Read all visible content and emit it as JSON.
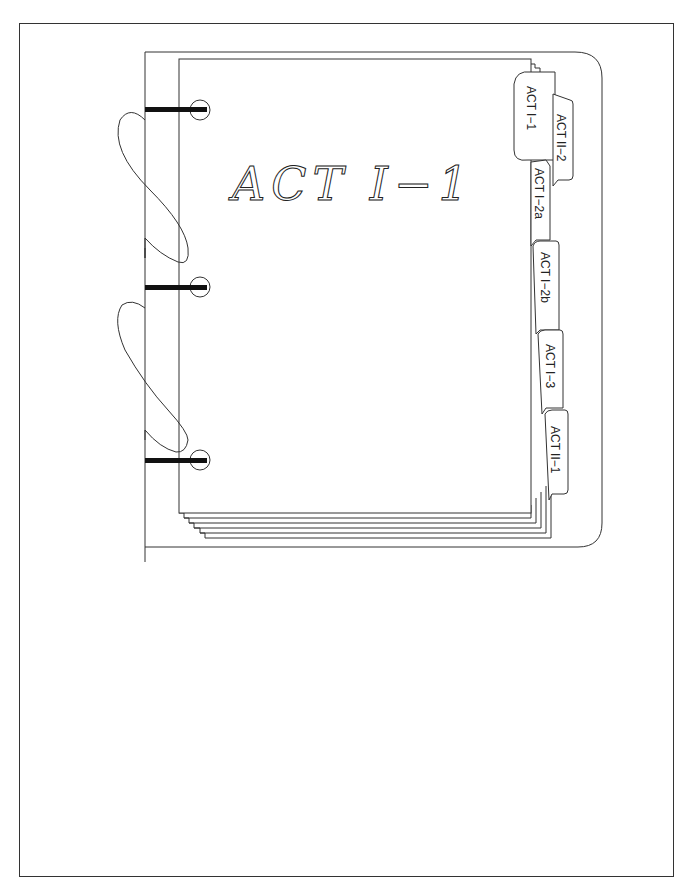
{
  "diagram": {
    "type": "binder-with-tab-dividers",
    "cover_title": "ACT I-1",
    "cover_title_display": "ACT  I−1",
    "rings": 3,
    "tabs": [
      {
        "label": "ACT I-1",
        "display": "ACT  I−1"
      },
      {
        "label": "ACT II-2",
        "display": "ACT  II−2"
      },
      {
        "label": "ACT I-2a",
        "display": "ACT  I−2a"
      },
      {
        "label": "ACT I-2b",
        "display": "ACT  I−2b"
      },
      {
        "label": "ACT I-3",
        "display": "ACT  I−3"
      },
      {
        "label": "ACT II-1",
        "display": "ACT  II−1"
      }
    ],
    "colors": {
      "line": "#333333",
      "ring_bar": "#111111",
      "background": "#ffffff"
    }
  }
}
